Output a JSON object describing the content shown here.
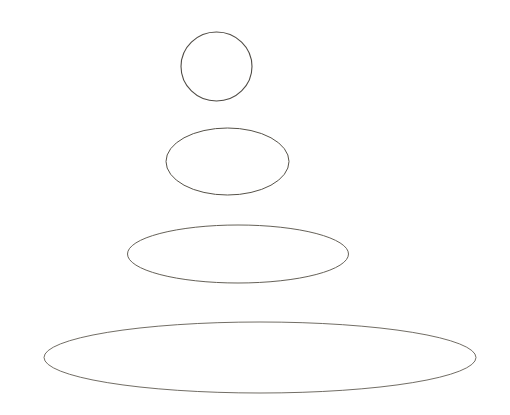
{
  "figure": {
    "background_color": "#ffffff",
    "width": 510,
    "height": 415,
    "stroke_color": "#5a564f",
    "caption_color": "#c9c6c0",
    "clipped_caption_text": "···  ···  ····  ··  ···  ··  ····  ···  ·····  ···  ···",
    "shapes": [
      {
        "name": "circle-top",
        "label": "circle",
        "cx": 216.5,
        "cy": 66.5,
        "rx": 35.5,
        "ry": 34.5,
        "stroke": "#4f4b45",
        "stroke_width": 1.1
      },
      {
        "name": "ellipse-second",
        "label": "ellipse",
        "cx": 227.5,
        "cy": 161.5,
        "rx": 61.5,
        "ry": 33.5,
        "stroke": "#565249",
        "stroke_width": 1.0
      },
      {
        "name": "ellipse-third",
        "label": "ellipse",
        "cx": 238.0,
        "cy": 254.0,
        "rx": 110.5,
        "ry": 29.0,
        "stroke": "#5d584f",
        "stroke_width": 0.95
      },
      {
        "name": "ellipse-largest",
        "label": "ellipse",
        "cx": 260.0,
        "cy": 357.5,
        "rx": 216.0,
        "ry": 35.5,
        "stroke": "#615c53",
        "stroke_width": 0.9
      }
    ]
  }
}
